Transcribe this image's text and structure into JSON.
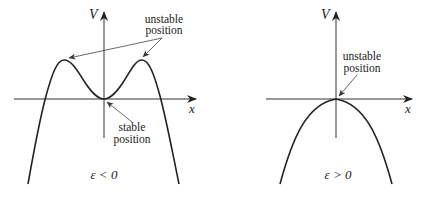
{
  "figure": {
    "left_panel": {
      "condition": "ε < 0",
      "y_axis_label": "V",
      "x_axis_label": "x",
      "annotations": {
        "unstable_line1": "unstable",
        "unstable_line2": "position",
        "stable_line1": "stable",
        "stable_line2": "position"
      },
      "curve": "double-hump potential: maxima at two symmetric points, minimum at origin"
    },
    "right_panel": {
      "condition": "ε > 0",
      "y_axis_label": "V",
      "x_axis_label": "x",
      "annotations": {
        "unstable_line1": "unstable",
        "unstable_line2": "position"
      },
      "curve": "inverted parabola with maximum at origin"
    },
    "colors": {
      "curve": "#222222",
      "axes": "#333333",
      "background": "#ffffff"
    }
  }
}
